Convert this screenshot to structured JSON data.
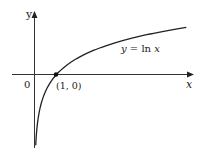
{
  "chart_data": {
    "type": "line",
    "title": "",
    "function": "y = ln x",
    "xlabel": "x",
    "ylabel": "y",
    "origin_label": "0",
    "curve_label": "y = ln x",
    "marked_points": [
      {
        "x": 1,
        "y": 0,
        "label": "(1, 0)"
      }
    ],
    "x": [
      0.055,
      0.1,
      0.2,
      0.3,
      0.5,
      0.75,
      1,
      1.5,
      2,
      3,
      4,
      5,
      6,
      6.9
    ],
    "series": [
      {
        "name": "y = ln x",
        "values": [
          -2.9,
          -2.3,
          -1.61,
          -1.2,
          -0.69,
          -0.29,
          0,
          0.41,
          0.69,
          1.1,
          1.39,
          1.61,
          1.79,
          1.93
        ]
      }
    ],
    "xlim": [
      -1.5,
      7.2
    ],
    "ylim": [
      -3.0,
      2.6
    ],
    "grid": false,
    "legend": "none",
    "colors": {
      "curve": "#222222",
      "axes": "#333333",
      "point": "#111111"
    }
  },
  "labels": {
    "y_axis": "y",
    "x_axis": "x",
    "origin": "0",
    "point": "(1, 0)",
    "curve_lhs": "y = ",
    "curve_ln": "ln ",
    "curve_x": "x"
  }
}
